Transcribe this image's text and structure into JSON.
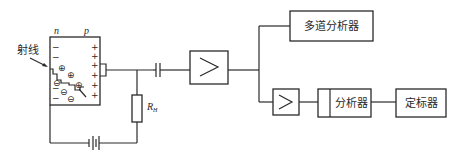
{
  "diagram": {
    "detector": {
      "n_label": "n",
      "p_label": "p",
      "ray_label": "射线",
      "minus_sign": "−",
      "plus_sign": "+",
      "hole_symbol": "⊕",
      "electron_symbol": "⊖"
    },
    "resistor": {
      "label": "R",
      "subscript": "H"
    },
    "blocks": {
      "multichannel_analyzer": "多道分析器",
      "main_amplifier_symbol": ">",
      "second_amplifier_symbol": ">",
      "analyzer": "分析器",
      "scaler": "定标器"
    }
  }
}
